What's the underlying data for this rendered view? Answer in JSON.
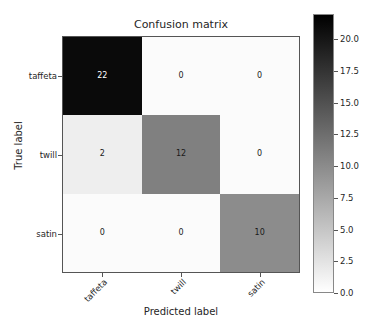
{
  "chart_data": {
    "type": "heatmap",
    "title": "Confusion matrix",
    "xlabel": "Predicted label",
    "ylabel": "True label",
    "categories": [
      "taffeta",
      "twill",
      "satin"
    ],
    "x_tick_labels": [
      "taffeta",
      "twill",
      "satin"
    ],
    "y_tick_labels": [
      "taffeta",
      "twill",
      "satin"
    ],
    "matrix": [
      [
        22,
        0,
        0
      ],
      [
        2,
        12,
        0
      ],
      [
        0,
        0,
        10
      ]
    ],
    "rows": [
      {
        "label": "taffeta",
        "cells": [
          {
            "value": "22",
            "fill": "#0a0a0a",
            "text_color": "#ffffff"
          },
          {
            "value": "0",
            "fill": "#fbfbfb",
            "text_color": "#1a1a1a"
          },
          {
            "value": "0",
            "fill": "#fbfbfb",
            "text_color": "#1a1a1a"
          }
        ]
      },
      {
        "label": "twill",
        "cells": [
          {
            "value": "2",
            "fill": "#eeeeee",
            "text_color": "#1a1a1a"
          },
          {
            "value": "12",
            "fill": "#808080",
            "text_color": "#1a1a1a"
          },
          {
            "value": "0",
            "fill": "#fbfbfb",
            "text_color": "#1a1a1a"
          }
        ]
      },
      {
        "label": "satin",
        "cells": [
          {
            "value": "0",
            "fill": "#fbfbfb",
            "text_color": "#1a1a1a"
          },
          {
            "value": "0",
            "fill": "#fbfbfb",
            "text_color": "#1a1a1a"
          },
          {
            "value": "10",
            "fill": "#8c8c8c",
            "text_color": "#1a1a1a"
          }
        ]
      }
    ],
    "colormap": "gray_r",
    "colorbar": {
      "ticks": [
        "20.0",
        "17.5",
        "15.0",
        "12.5",
        "10.0",
        "7.5",
        "5.0",
        "2.5",
        "0.0"
      ],
      "tick_values": [
        20.0,
        17.5,
        15.0,
        12.5,
        10.0,
        7.5,
        5.0,
        2.5,
        0.0
      ],
      "vmin": 0.0,
      "vmax": 22.0,
      "orientation": "vertical",
      "top_color": "#000000",
      "bottom_color": "#ffffff"
    },
    "grid": false,
    "legend": "none"
  }
}
